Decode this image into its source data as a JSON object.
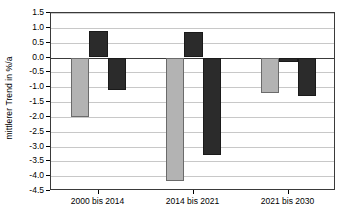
{
  "chart_data": {
    "type": "bar",
    "title": "",
    "xlabel": "",
    "ylabel": "mittlerer Trend in %/a",
    "categories": [
      "2000 bis 2014",
      "2014 bis 2021",
      "2021 bis 2030"
    ],
    "series": [
      {
        "name": "Reihe 1",
        "color": "#b3b3b3",
        "values": [
          -2.0,
          -4.15,
          -1.2
        ]
      },
      {
        "name": "Reihe 2",
        "color": "#2b2b2b",
        "values": [
          0.9,
          0.85,
          -0.15
        ]
      },
      {
        "name": "Reihe 3",
        "color": "#2b2b2b",
        "values": [
          -1.1,
          -3.3,
          -1.3
        ]
      }
    ],
    "ylim": [
      -4.5,
      1.5
    ],
    "ytick_step": 0.5,
    "yticks": [
      1.5,
      1.0,
      0.5,
      0.0,
      -0.5,
      -1.0,
      -1.5,
      -2.0,
      -2.5,
      -3.0,
      -3.5,
      -4.0,
      -4.5
    ],
    "ytick_labels": [
      "1.5",
      "1.0",
      "0.5",
      "0.0",
      "-0.5",
      "-1.0",
      "-1.5",
      "-2.0",
      "-2.5",
      "-3.0",
      "-3.5",
      "-4.0",
      "-4.5"
    ],
    "grid": true,
    "legend": "none",
    "zero_line": 0.0
  },
  "colors": {
    "series_light": "#b3b3b3",
    "series_dark": "#2b2b2b",
    "gridline": "#c8c8c8",
    "axis": "#3a3a3a",
    "text": "#000000",
    "background": "#ffffff"
  }
}
